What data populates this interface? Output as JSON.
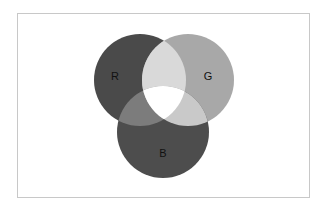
{
  "diagram": {
    "type": "venn",
    "sets": [
      {
        "id": "R",
        "label": "R",
        "cx": 140,
        "cy": 80,
        "r": 46,
        "color": "#4a4a4a",
        "label_pos": [
          115,
          77
        ]
      },
      {
        "id": "G",
        "label": "G",
        "cx": 188,
        "cy": 80,
        "r": 46,
        "color": "#a8a8a8",
        "label_pos": [
          208,
          77
        ]
      },
      {
        "id": "B",
        "label": "B",
        "cx": 163,
        "cy": 132,
        "r": 46,
        "color": "#4d4d4d",
        "label_pos": [
          163,
          154
        ]
      }
    ],
    "overlaps": {
      "RG": "#d9d9d9",
      "RB": "#7c7c7c",
      "GB": "#c9c9c9",
      "RGB": "#ffffff"
    },
    "frame_border": "#c8c8c8"
  }
}
